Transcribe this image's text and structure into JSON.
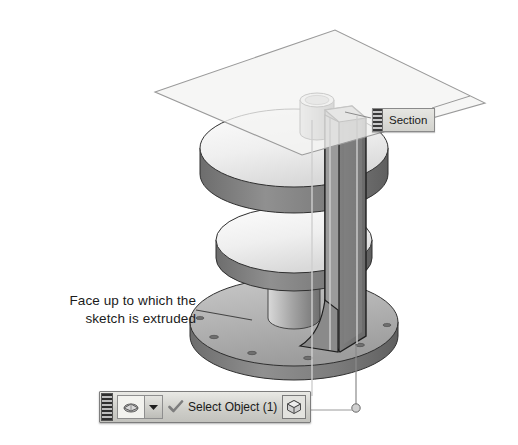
{
  "scene": {
    "title": "Extrude to face — section view",
    "background_color": "#ffffff"
  },
  "annotation": {
    "name": "face-callout",
    "line1": "Face up to which the",
    "line2": "sketch is extruded",
    "leader": "leader-line"
  },
  "section_label": {
    "text": "Section",
    "grip_icon": "drag-grip-icon"
  },
  "toolbar": {
    "grip_icon": "drag-grip-icon",
    "filter_icon": "solid-body-filter-icon",
    "dropdown_icon": "chevron-down-icon",
    "confirm_icon": "check-icon",
    "status_text": "Select Object (1)",
    "cube_icon": "cube-icon"
  },
  "model": {
    "parts": [
      {
        "name": "section-plane",
        "kind": "translucent-plane"
      },
      {
        "name": "top-flange-disk",
        "kind": "cylinder-disk"
      },
      {
        "name": "middle-flange-disk",
        "kind": "cylinder-disk"
      },
      {
        "name": "base-flange-disk",
        "kind": "cylinder-disk",
        "highlighted": true
      },
      {
        "name": "top-boss-cylinder",
        "kind": "cylinder"
      },
      {
        "name": "vertical-rib",
        "kind": "extruded-web"
      },
      {
        "name": "center-column",
        "kind": "cylinder"
      }
    ]
  },
  "colors": {
    "face_light": "#f2f2f2",
    "face_mid": "#b9b9b9",
    "face_dark": "#8e8e8e",
    "face_darker": "#6e6e6e",
    "outline": "#2a2a2a",
    "plane_fill": "#f4f4f2",
    "plane_edge": "#9a9a9a",
    "leader": "#555555",
    "text": "#1b1b1b",
    "toolbar_face": "#cfcfca"
  }
}
